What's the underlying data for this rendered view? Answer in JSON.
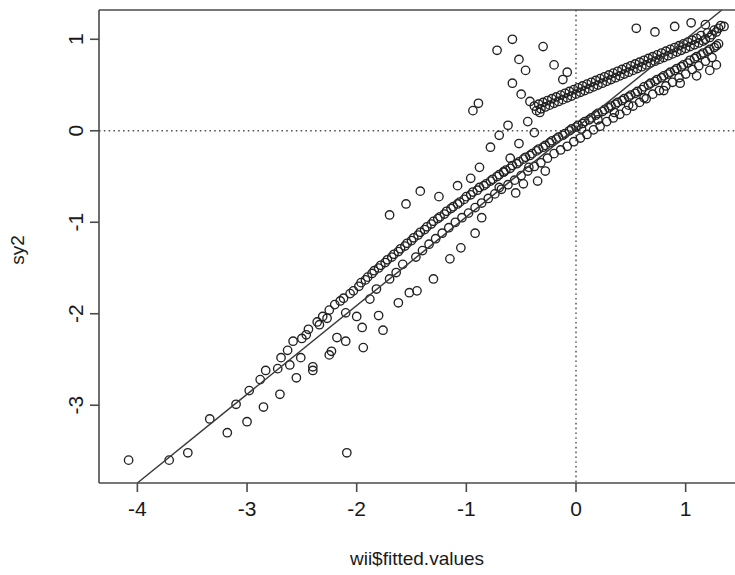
{
  "chart_data": {
    "type": "scatter",
    "title": "",
    "subtitle": "",
    "xlabel": "wii$fitted.values",
    "ylabel": "sy2",
    "xlim": [
      -4.35,
      1.45
    ],
    "ylim": [
      -3.85,
      1.32
    ],
    "xticks": [
      -4,
      -3,
      -2,
      -1,
      0,
      1
    ],
    "xtick_labels": [
      "-4",
      "-3",
      "-2",
      "-1",
      "0",
      "1"
    ],
    "yticks": [
      1,
      0,
      -1,
      -2,
      -3
    ],
    "ytick_labels": [
      "1",
      "0",
      "-1",
      "-2",
      "-3"
    ],
    "grid": false,
    "legend": null,
    "annotations": [],
    "reference_lines": [
      {
        "name": "horizontal-zero-line",
        "orientation": "horizontal",
        "value": 0,
        "style": "dotted"
      },
      {
        "name": "vertical-zero-line",
        "orientation": "vertical",
        "value": 0,
        "style": "dotted"
      }
    ],
    "fit_line": {
      "name": "identity-fit-line",
      "style": "solid",
      "x_start": -4.0,
      "y_start": -3.85,
      "x_end": 1.33,
      "y_end": 1.32
    },
    "marker": {
      "shape": "open-circle",
      "radius_px": 4.2,
      "stroke": "#222222",
      "fill": "none"
    },
    "colors": {
      "point_stroke": "#222222",
      "fit_line": "#3a3a3a",
      "reference_line": "#55555a",
      "axis": "#4a4a4a",
      "background": "#ffffff",
      "text": "#1a1a1a"
    },
    "point_count": 352,
    "points": [
      [
        -4.08,
        -3.6
      ],
      [
        -3.71,
        -3.6
      ],
      [
        -3.54,
        -3.52
      ],
      [
        -3.34,
        -3.15
      ],
      [
        -3.1,
        -2.99
      ],
      [
        -2.98,
        -2.84
      ],
      [
        -2.88,
        -2.72
      ],
      [
        -2.83,
        -2.62
      ],
      [
        -2.72,
        -2.6
      ],
      [
        -2.69,
        -2.48
      ],
      [
        -2.63,
        -2.4
      ],
      [
        -2.61,
        -2.56
      ],
      [
        -2.58,
        -2.3
      ],
      [
        -2.51,
        -2.48
      ],
      [
        -2.5,
        -2.27
      ],
      [
        -2.46,
        -2.23
      ],
      [
        -2.44,
        -2.17
      ],
      [
        -2.4,
        -2.62
      ],
      [
        -2.36,
        -2.09
      ],
      [
        -2.34,
        -2.12
      ],
      [
        -2.31,
        -2.03
      ],
      [
        -2.27,
        -2.05
      ],
      [
        -2.25,
        -1.96
      ],
      [
        -2.23,
        -2.41
      ],
      [
        -2.2,
        -1.9
      ],
      [
        -2.18,
        -2.26
      ],
      [
        -2.15,
        -1.86
      ],
      [
        -2.12,
        -1.83
      ],
      [
        -2.1,
        -1.99
      ],
      [
        -2.09,
        -3.52
      ],
      [
        -2.06,
        -1.78
      ],
      [
        -2.03,
        -1.75
      ],
      [
        -2.0,
        -2.03
      ],
      [
        -1.98,
        -1.7
      ],
      [
        -1.96,
        -1.66
      ],
      [
        -1.94,
        -2.37
      ],
      [
        -1.92,
        -1.63
      ],
      [
        -1.9,
        -1.6
      ],
      [
        -1.88,
        -1.84
      ],
      [
        -1.86,
        -1.56
      ],
      [
        -1.84,
        -1.53
      ],
      [
        -1.82,
        -1.73
      ],
      [
        -1.8,
        -1.5
      ],
      [
        -1.78,
        -1.47
      ],
      [
        -1.76,
        -2.18
      ],
      [
        -1.74,
        -1.44
      ],
      [
        -1.72,
        -1.41
      ],
      [
        -1.7,
        -1.62
      ],
      [
        -1.68,
        -1.38
      ],
      [
        -1.66,
        -1.35
      ],
      [
        -1.64,
        -1.55
      ],
      [
        -1.62,
        -1.32
      ],
      [
        -1.6,
        -1.29
      ],
      [
        -1.58,
        -1.46
      ],
      [
        -1.56,
        -1.26
      ],
      [
        -1.54,
        -1.23
      ],
      [
        -1.52,
        -1.77
      ],
      [
        -1.5,
        -1.2
      ],
      [
        -1.48,
        -1.17
      ],
      [
        -1.46,
        -1.38
      ],
      [
        -1.44,
        -1.14
      ],
      [
        -1.42,
        -1.11
      ],
      [
        -1.4,
        -1.31
      ],
      [
        -1.38,
        -1.08
      ],
      [
        -1.36,
        -1.05
      ],
      [
        -1.34,
        -1.24
      ],
      [
        -1.32,
        -1.02
      ],
      [
        -1.3,
        -0.99
      ],
      [
        -1.28,
        -1.18
      ],
      [
        -1.26,
        -0.96
      ],
      [
        -1.24,
        -0.94
      ],
      [
        -1.22,
        -1.12
      ],
      [
        -1.2,
        -0.91
      ],
      [
        -1.18,
        -0.88
      ],
      [
        -1.16,
        -1.06
      ],
      [
        -1.14,
        -0.85
      ],
      [
        -1.12,
        -0.83
      ],
      [
        -1.1,
        -1.0
      ],
      [
        -1.08,
        -0.8
      ],
      [
        -1.06,
        -0.78
      ],
      [
        -1.04,
        -0.95
      ],
      [
        -1.02,
        -0.75
      ],
      [
        -1.0,
        -0.72
      ],
      [
        -0.98,
        -0.9
      ],
      [
        -0.96,
        -0.7
      ],
      [
        -0.94,
        -0.67
      ],
      [
        -0.92,
        -0.84
      ],
      [
        -0.9,
        -0.65
      ],
      [
        -0.88,
        -0.62
      ],
      [
        -0.86,
        -0.79
      ],
      [
        -0.84,
        -0.6
      ],
      [
        -0.82,
        -0.58
      ],
      [
        -0.8,
        -0.74
      ],
      [
        -0.78,
        -0.55
      ],
      [
        -0.76,
        -0.53
      ],
      [
        -0.74,
        -0.69
      ],
      [
        -0.72,
        -0.5
      ],
      [
        -0.7,
        -0.48
      ],
      [
        -0.68,
        -0.64
      ],
      [
        -0.66,
        -0.45
      ],
      [
        -0.64,
        -0.43
      ],
      [
        -0.62,
        -0.59
      ],
      [
        -0.6,
        -0.41
      ],
      [
        -0.58,
        -0.38
      ],
      [
        -0.56,
        -0.54
      ],
      [
        -0.54,
        -0.36
      ],
      [
        -0.52,
        -0.34
      ],
      [
        -0.5,
        -0.49
      ],
      [
        -0.48,
        -0.31
      ],
      [
        -0.46,
        -0.29
      ],
      [
        -0.44,
        -0.44
      ],
      [
        -0.42,
        -0.27
      ],
      [
        -0.4,
        -0.25
      ],
      [
        -0.38,
        -0.39
      ],
      [
        -0.36,
        -0.22
      ],
      [
        -0.34,
        -0.2
      ],
      [
        -0.32,
        -0.35
      ],
      [
        -0.3,
        -0.18
      ],
      [
        -0.28,
        -0.16
      ],
      [
        -0.26,
        -0.3
      ],
      [
        -0.24,
        -0.13
      ],
      [
        -0.22,
        -0.11
      ],
      [
        -0.2,
        -0.25
      ],
      [
        -0.18,
        -0.09
      ],
      [
        -0.16,
        -0.07
      ],
      [
        -0.14,
        -0.21
      ],
      [
        -0.12,
        -0.05
      ],
      [
        -0.1,
        -0.03
      ],
      [
        -0.08,
        -0.17
      ],
      [
        -0.06,
        0.0
      ],
      [
        -0.04,
        0.02
      ],
      [
        -0.02,
        -0.12
      ],
      [
        0.0,
        0.04
      ],
      [
        0.02,
        0.06
      ],
      [
        0.04,
        -0.08
      ],
      [
        0.06,
        0.08
      ],
      [
        0.08,
        0.1
      ],
      [
        0.1,
        -0.04
      ],
      [
        0.12,
        0.12
      ],
      [
        0.14,
        0.14
      ],
      [
        0.16,
        0.01
      ],
      [
        0.18,
        0.17
      ],
      [
        0.2,
        0.19
      ],
      [
        0.22,
        0.05
      ],
      [
        0.24,
        0.21
      ],
      [
        0.26,
        0.23
      ],
      [
        0.28,
        0.1
      ],
      [
        0.3,
        0.25
      ],
      [
        0.32,
        0.27
      ],
      [
        0.34,
        0.14
      ],
      [
        0.36,
        0.29
      ],
      [
        0.38,
        0.31
      ],
      [
        0.4,
        0.18
      ],
      [
        0.42,
        0.33
      ],
      [
        0.44,
        0.35
      ],
      [
        0.46,
        0.22
      ],
      [
        0.48,
        0.37
      ],
      [
        0.5,
        0.39
      ],
      [
        0.52,
        0.27
      ],
      [
        0.54,
        0.41
      ],
      [
        0.56,
        0.43
      ],
      [
        0.58,
        0.31
      ],
      [
        0.6,
        0.45
      ],
      [
        0.62,
        0.48
      ],
      [
        0.64,
        0.35
      ],
      [
        0.66,
        0.5
      ],
      [
        0.68,
        0.52
      ],
      [
        0.7,
        0.4
      ],
      [
        0.72,
        0.54
      ],
      [
        0.74,
        0.56
      ],
      [
        0.76,
        0.44
      ],
      [
        0.78,
        0.58
      ],
      [
        0.8,
        0.6
      ],
      [
        0.82,
        0.49
      ],
      [
        0.84,
        0.62
      ],
      [
        0.86,
        0.64
      ],
      [
        0.88,
        0.53
      ],
      [
        0.9,
        0.66
      ],
      [
        0.92,
        0.68
      ],
      [
        0.94,
        0.58
      ],
      [
        0.96,
        0.7
      ],
      [
        0.98,
        0.72
      ],
      [
        1.0,
        0.62
      ],
      [
        1.02,
        0.74
      ],
      [
        1.04,
        0.77
      ],
      [
        1.06,
        0.67
      ],
      [
        1.08,
        0.79
      ],
      [
        1.1,
        0.81
      ],
      [
        1.12,
        0.71
      ],
      [
        1.14,
        0.83
      ],
      [
        1.16,
        0.85
      ],
      [
        1.18,
        0.76
      ],
      [
        1.2,
        0.87
      ],
      [
        1.22,
        0.89
      ],
      [
        1.24,
        0.8
      ],
      [
        1.26,
        0.91
      ],
      [
        1.28,
        0.93
      ],
      [
        1.3,
        0.95
      ],
      [
        1.32,
        1.15
      ],
      [
        1.3,
        1.12
      ],
      [
        1.28,
        1.08
      ],
      [
        1.26,
        1.1
      ],
      [
        1.24,
        1.05
      ],
      [
        1.22,
        1.02
      ],
      [
        1.2,
        1.07
      ],
      [
        1.18,
        1.0
      ],
      [
        1.16,
        0.98
      ],
      [
        1.14,
        1.04
      ],
      [
        1.12,
        0.96
      ],
      [
        1.1,
        1.01
      ],
      [
        1.08,
        0.94
      ],
      [
        1.06,
        0.99
      ],
      [
        1.04,
        0.92
      ],
      [
        1.02,
        0.97
      ],
      [
        1.0,
        0.9
      ],
      [
        0.98,
        0.95
      ],
      [
        0.96,
        0.88
      ],
      [
        0.94,
        0.93
      ],
      [
        0.92,
        0.86
      ],
      [
        0.9,
        0.91
      ],
      [
        0.88,
        0.84
      ],
      [
        0.86,
        0.89
      ],
      [
        0.84,
        0.82
      ],
      [
        0.82,
        0.87
      ],
      [
        0.8,
        0.8
      ],
      [
        0.78,
        0.85
      ],
      [
        0.76,
        0.78
      ],
      [
        0.74,
        0.83
      ],
      [
        0.72,
        0.76
      ],
      [
        0.7,
        0.81
      ],
      [
        0.68,
        0.74
      ],
      [
        0.66,
        0.79
      ],
      [
        0.64,
        0.72
      ],
      [
        0.62,
        0.77
      ],
      [
        0.6,
        0.7
      ],
      [
        0.58,
        0.75
      ],
      [
        0.56,
        0.68
      ],
      [
        0.54,
        0.73
      ],
      [
        0.52,
        0.66
      ],
      [
        0.5,
        0.71
      ],
      [
        0.48,
        0.64
      ],
      [
        0.46,
        0.69
      ],
      [
        0.44,
        0.62
      ],
      [
        0.42,
        0.67
      ],
      [
        0.4,
        0.6
      ],
      [
        0.38,
        0.65
      ],
      [
        0.36,
        0.58
      ],
      [
        0.34,
        0.63
      ],
      [
        0.32,
        0.56
      ],
      [
        0.3,
        0.61
      ],
      [
        0.28,
        0.54
      ],
      [
        0.26,
        0.59
      ],
      [
        0.24,
        0.52
      ],
      [
        0.22,
        0.57
      ],
      [
        0.2,
        0.5
      ],
      [
        0.18,
        0.55
      ],
      [
        0.16,
        0.48
      ],
      [
        0.14,
        0.53
      ],
      [
        0.12,
        0.46
      ],
      [
        0.1,
        0.51
      ],
      [
        0.08,
        0.44
      ],
      [
        0.06,
        0.49
      ],
      [
        0.04,
        0.42
      ],
      [
        0.02,
        0.47
      ],
      [
        0.0,
        0.4
      ],
      [
        -0.02,
        0.45
      ],
      [
        -0.04,
        0.38
      ],
      [
        -0.06,
        0.43
      ],
      [
        -0.08,
        0.36
      ],
      [
        -0.1,
        0.41
      ],
      [
        -0.12,
        0.34
      ],
      [
        -0.14,
        0.39
      ],
      [
        -0.16,
        0.32
      ],
      [
        -0.18,
        0.37
      ],
      [
        -0.2,
        0.3
      ],
      [
        -0.22,
        0.35
      ],
      [
        -0.24,
        0.28
      ],
      [
        -0.26,
        0.33
      ],
      [
        -0.28,
        0.26
      ],
      [
        -0.3,
        0.31
      ],
      [
        -0.32,
        0.24
      ],
      [
        -0.34,
        0.29
      ],
      [
        -0.36,
        0.22
      ],
      [
        -0.38,
        0.27
      ],
      [
        -0.58,
        1.0
      ],
      [
        -0.72,
        0.88
      ],
      [
        -0.52,
        0.78
      ],
      [
        -0.46,
        0.66
      ],
      [
        -0.89,
        0.3
      ],
      [
        -0.94,
        0.22
      ],
      [
        -0.44,
        0.1
      ],
      [
        -0.38,
        -0.02
      ],
      [
        -0.52,
        -0.14
      ],
      [
        -0.6,
        -0.3
      ],
      [
        -0.66,
        -0.45
      ],
      [
        -0.7,
        -0.62
      ],
      [
        -0.55,
        -0.68
      ],
      [
        -0.48,
        -0.58
      ],
      [
        -0.43,
        -0.4
      ],
      [
        -0.86,
        -0.95
      ],
      [
        -0.92,
        -1.12
      ],
      [
        -1.05,
        -1.28
      ],
      [
        -1.15,
        -1.4
      ],
      [
        -1.25,
        -0.72
      ],
      [
        -1.42,
        -0.66
      ],
      [
        -1.55,
        -0.8
      ],
      [
        -1.7,
        -0.92
      ],
      [
        -1.3,
        -1.62
      ],
      [
        -1.45,
        -1.75
      ],
      [
        -1.62,
        -1.88
      ],
      [
        -1.8,
        -2.02
      ],
      [
        -1.95,
        -2.15
      ],
      [
        -2.1,
        -2.3
      ],
      [
        -2.25,
        -2.45
      ],
      [
        -2.4,
        -2.58
      ],
      [
        -2.55,
        -2.7
      ],
      [
        -0.3,
        0.92
      ],
      [
        -0.2,
        0.72
      ],
      [
        -0.12,
        0.56
      ],
      [
        -0.08,
        0.64
      ],
      [
        0.55,
        1.12
      ],
      [
        0.72,
        1.08
      ],
      [
        0.9,
        1.14
      ],
      [
        1.05,
        1.18
      ],
      [
        1.18,
        1.16
      ],
      [
        1.35,
        1.14
      ],
      [
        1.28,
        0.72
      ],
      [
        1.22,
        0.66
      ],
      [
        1.1,
        0.6
      ],
      [
        0.95,
        0.52
      ],
      [
        0.8,
        0.44
      ],
      [
        0.62,
        0.36
      ],
      [
        0.48,
        0.28
      ],
      [
        0.35,
        0.2
      ],
      [
        0.2,
        0.12
      ],
      [
        0.05,
        0.02
      ],
      [
        -0.62,
        0.06
      ],
      [
        -0.7,
        -0.05
      ],
      [
        -0.78,
        -0.18
      ],
      [
        -0.88,
        -0.4
      ],
      [
        -0.96,
        -0.52
      ],
      [
        -1.08,
        -0.6
      ],
      [
        -0.35,
        -0.55
      ],
      [
        -0.28,
        -0.44
      ],
      [
        -2.7,
        -2.88
      ],
      [
        -2.85,
        -3.02
      ],
      [
        -3.0,
        -3.18
      ],
      [
        -3.18,
        -3.3
      ],
      [
        -0.58,
        0.52
      ],
      [
        -0.5,
        0.4
      ],
      [
        -0.42,
        0.32
      ],
      [
        -0.33,
        0.2
      ]
    ]
  },
  "axes": {
    "x_axis_name": "x-axis",
    "y_axis_name": "y-axis",
    "x_title": "wii$fitted.values",
    "y_title": "sy2"
  }
}
